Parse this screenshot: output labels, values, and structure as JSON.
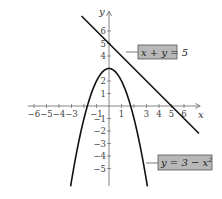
{
  "chart_data": {
    "type": "line",
    "title": "",
    "xlabel": "x",
    "ylabel": "y",
    "xlim": [
      -6.5,
      7.3
    ],
    "ylim": [
      -6.4,
      7.6
    ],
    "grid": false,
    "x_ticks": [
      -6,
      -5,
      -4,
      -3,
      -2,
      -1,
      1,
      2,
      3,
      4,
      5,
      6
    ],
    "x_tick_labels": [
      "−6",
      "−5",
      "−4",
      "−3",
      "",
      "−1",
      "1",
      "",
      "3",
      "4",
      "5",
      "6"
    ],
    "y_ticks": [
      -5,
      -4,
      -3,
      -2,
      -1,
      1,
      2,
      3,
      4,
      5,
      6
    ],
    "y_tick_labels": [
      "−5",
      "−4",
      "−3",
      "−2",
      "−1",
      "1",
      "2",
      "",
      "4",
      "5",
      "6"
    ],
    "series": [
      {
        "name": "x + y = 5",
        "kind": "line",
        "equation": "y = 5 - x",
        "x_range": [
          -2.2,
          7.2
        ]
      },
      {
        "name": "y = 3 − x²",
        "kind": "parabola",
        "equation": "y = 3 - x^2",
        "x_range": [
          -3.07,
          3.07
        ],
        "vertex": [
          0,
          3
        ]
      }
    ],
    "annotations": [
      {
        "text": "x + y = 5",
        "attached_to": "line"
      },
      {
        "text": "y = 3 − x²",
        "attached_to": "parabola"
      }
    ]
  },
  "labels": {
    "x_axis": "x",
    "y_axis": "y",
    "line_eq_lhs": "x + y = 5",
    "parabola_eq": "y = 3 − x",
    "parabola_exp": "2"
  },
  "colors": {
    "curve": "#111111",
    "axis": "#666666",
    "label_box_fill": "#b8b8b8",
    "label_box_stroke": "#555555"
  }
}
